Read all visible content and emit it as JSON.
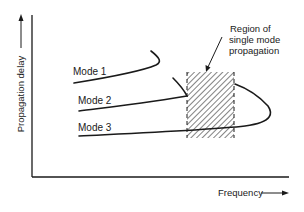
{
  "diagram": {
    "y_axis_label": "Propagation delay",
    "x_axis_label": "Frequency",
    "modes": [
      {
        "label": "Mode 1"
      },
      {
        "label": "Mode 2"
      },
      {
        "label": "Mode 3"
      }
    ],
    "region_annotation": {
      "line1": "Region of",
      "line2": "single mode",
      "line3": "propagation"
    },
    "colors": {
      "ink": "#1a1a1a",
      "background": "#ffffff"
    }
  }
}
